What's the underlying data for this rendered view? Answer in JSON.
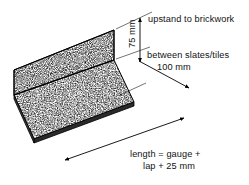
{
  "figure": {
    "type": "isometric-technical-drawing",
    "background_color": "#ffffff",
    "line_color": "#000000",
    "texture": "stipple-speckle"
  },
  "labels": {
    "upstand": "upstand to brickwork",
    "upstand_dimension": "75 mm",
    "between": "between slates/tiles",
    "between_dimension": "100 mm",
    "length_line1": "length = gauge +",
    "length_line2": "lap + 25 mm"
  },
  "dimensions": [
    {
      "name": "upstand-height",
      "value": "75 mm",
      "description": "upstand to brickwork",
      "orientation": "vertical"
    },
    {
      "name": "base-width",
      "value": "100 mm",
      "description": "between slates/tiles",
      "orientation": "diagonal"
    },
    {
      "name": "overall-length",
      "value": "length = gauge + lap + 25 mm",
      "description": "length along the slope",
      "orientation": "diagonal"
    }
  ]
}
